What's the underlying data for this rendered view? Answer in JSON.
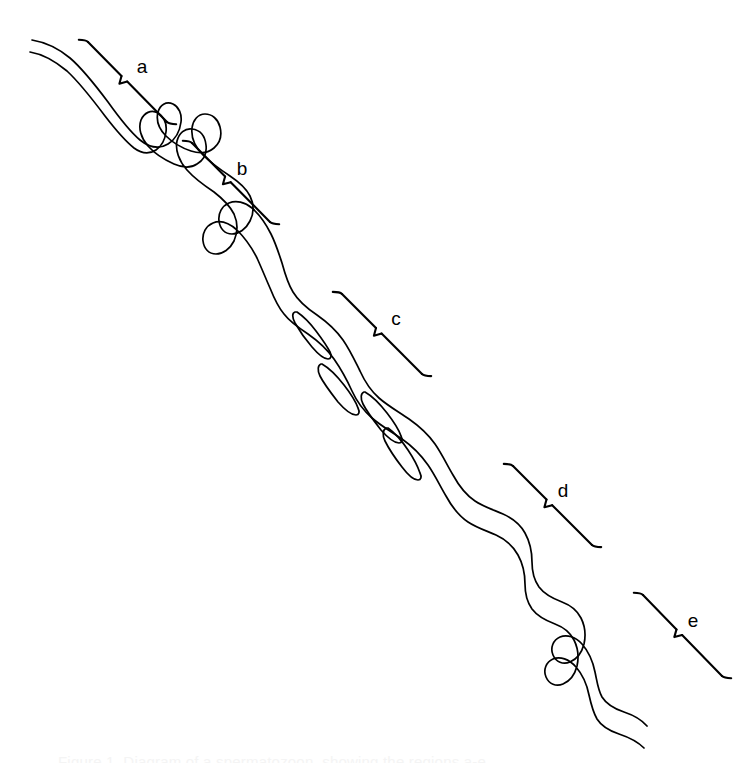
{
  "figure": {
    "kind": "scientific-line-drawing",
    "subject": "spermatozoon",
    "background_color": "#ffffff",
    "ink_color": "#000000",
    "width": 750,
    "height": 763,
    "orientation": "diagonal, upper-left to lower-right"
  },
  "labels": [
    {
      "id": "a",
      "text": "a",
      "label_x": 142,
      "label_y": 68,
      "bracket_start_x": 88,
      "bracket_start_y": 42,
      "bracket_end_x": 167,
      "bracket_end_y": 122,
      "notch_t": 0.46
    },
    {
      "id": "b",
      "text": "b",
      "label_x": 242,
      "label_y": 170,
      "bracket_start_x": 192,
      "bracket_start_y": 143,
      "bracket_end_x": 270,
      "bracket_end_y": 222,
      "notch_t": 0.46
    },
    {
      "id": "c",
      "text": "c",
      "label_x": 396,
      "label_y": 320,
      "bracket_start_x": 342,
      "bracket_start_y": 294,
      "bracket_end_x": 422,
      "bracket_end_y": 374,
      "notch_t": 0.46
    },
    {
      "id": "d",
      "text": "d",
      "label_x": 563,
      "label_y": 492,
      "bracket_start_x": 513,
      "bracket_start_y": 466,
      "bracket_end_x": 592,
      "bracket_end_y": 545,
      "notch_t": 0.46
    },
    {
      "id": "e",
      "text": "e",
      "label_x": 693,
      "label_y": 622,
      "bracket_start_x": 643,
      "bracket_start_y": 595,
      "bracket_end_x": 722,
      "bracket_end_y": 676,
      "notch_t": 0.46
    }
  ],
  "body_paths": {
    "upper_edge": "M 32 40 C 44 42 58 48 70 58 C 84 70 96 86 108 102 C 118 116 128 130 140 140 C 150 148 160 149 168 144 C 176 139 180 130 181 122 C 182 114 179 107 173 104 C 166 101 160 105 158 112 C 156 120 159 129 166 136 C 173 143 182 148 191 151 C 200 154 208 153 214 148 C 220 143 222 135 220 127 C 218 119 212 114 205 114 C 198 114 193 120 192 128 C 191 137 195 147 203 155 C 211 163 221 170 230 176 C 239 182 246 188 250 196 C 254 204 254 213 250 221 C 246 229 239 234 232 234 C 225 234 220 229 219 221 C 218 213 222 206 229 203 C 236 200 245 202 252 208 C 260 215 266 224 271 234 C 276 244 279 254 282 263 C 285 274 288 284 293 292 C 299 302 308 309 317 315 C 327 322 336 330 343 340 C 350 350 355 361 360 371 C 365 382 371 391 379 398 C 388 406 399 412 409 419 C 419 426 428 434 435 444 C 442 454 447 465 453 475 C 459 486 466 495 475 501 C 484 507 494 510 503 514 C 512 518 520 524 525 533 C 530 542 532 552 532 562 C 532 571 534 580 539 587 C 545 595 554 599 562 602 C 570 605 577 610 581 618 C 585 626 586 635 584 644 C 582 652 577 659 570 662 C 563 665 556 662 553 655 C 550 648 553 640 560 637 C 567 634 576 637 582 644 C 589 652 593 662 595 672 C 597 681 598 690 602 697 C 607 705 615 709 624 712 C 633 715 641 719 647 726",
    "lower_edge": "M 30 52 C 42 54 55 61 67 71 C 81 84 93 100 105 116 C 115 129 124 140 134 148 C 142 154 150 154 156 150 C 162 146 165 139 166 132 C 167 124 164 117 158 113 C 151 109 144 113 141 120 C 138 128 141 138 148 146 C 155 154 165 160 174 164 C 183 168 191 168 197 164 C 204 160 207 153 206 145 C 205 136 200 130 192 129 C 185 128 179 133 177 141 C 175 150 179 161 187 170 C 195 179 205 186 214 192 C 223 199 230 206 234 214 C 238 223 238 232 234 241 C 230 249 223 254 216 254 C 209 254 204 249 203 241 C 202 233 206 226 213 223 C 220 220 229 223 237 230 C 245 238 252 248 257 258 C 262 269 266 279 270 288 C 274 298 278 307 284 314 C 290 322 299 328 308 334 C 318 341 327 349 334 359 C 341 369 347 380 352 391 C 357 402 364 411 372 418 C 381 426 392 432 402 439 C 412 446 421 455 428 465 C 435 475 440 486 446 496 C 452 507 459 516 468 522 C 477 528 487 531 496 535 C 505 539 513 546 518 555 C 523 564 525 574 525 584 C 525 593 527 602 532 609 C 538 617 547 621 555 624 C 563 627 570 632 574 640 C 578 648 579 657 577 666 C 575 674 570 681 563 684 C 556 687 549 684 546 677 C 543 670 546 662 553 659 C 560 656 569 659 576 667 C 583 675 587 685 589 695 C 591 704 593 712 597 719 C 602 727 610 731 619 734 C 628 737 637 741 644 748"
  },
  "slits": [
    {
      "id": "slit-1",
      "path": "M 297 312 C 303 316 310 323 316 331 C 322 339 327 346 330 352 C 332 356 331 359 328 359 C 324 359 318 354 312 347 C 305 339 299 330 295 323 C 292 317 292 313 295 312 Z"
    },
    {
      "id": "slit-2",
      "path": "M 322 364 C 329 368 337 376 344 385 C 351 394 356 402 358 408 C 360 412 359 415 356 415 C 352 415 345 410 338 402 C 331 393 324 384 320 376 C 317 370 318 365 321 364 Z"
    },
    {
      "id": "slit-3",
      "path": "M 365 392 C 372 396 380 404 387 413 C 394 422 399 430 401 436 C 403 440 402 443 399 443 C 395 443 388 438 381 430 C 374 421 367 412 363 404 C 360 398 361 393 364 392 Z"
    },
    {
      "id": "slit-4",
      "path": "M 388 428 C 395 433 402 441 408 450 C 414 459 418 467 420 473 C 422 477 421 480 418 480 C 414 480 408 475 402 467 C 395 458 389 449 385 441 C 382 435 383 430 386 428 Z"
    }
  ],
  "caption": {
    "text": "Figure 1. Diagram of a spermatozoon, showing the regions a-e.",
    "visibility": "clipped at bottom edge, nearly illegible"
  }
}
